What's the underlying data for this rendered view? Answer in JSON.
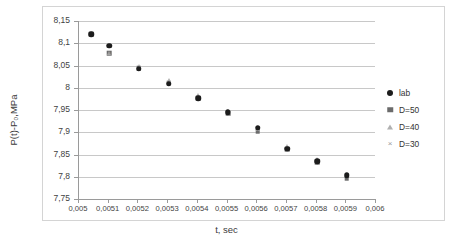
{
  "chart_data": {
    "type": "scatter",
    "title": "",
    "xlabel": "t, sec",
    "ylabel": "P(t)-P₀,MPa",
    "xlim": [
      0.005,
      0.006
    ],
    "ylim": [
      7.75,
      8.15
    ],
    "grid": true,
    "legend_position": "right",
    "x_ticks": [
      "0,005",
      "0,0051",
      "0,0052",
      "0,0053",
      "0,0054",
      "0,0055",
      "0,0056",
      "0,0057",
      "0,0058",
      "0,0059",
      "0,006"
    ],
    "x_tick_values": [
      0.005,
      0.0051,
      0.0052,
      0.0053,
      0.0054,
      0.0055,
      0.0056,
      0.0057,
      0.0058,
      0.0059,
      0.006
    ],
    "y_ticks": [
      "7,75",
      "7,8",
      "7,85",
      "7,9",
      "7,95",
      "8",
      "8,05",
      "8,1",
      "8,15"
    ],
    "y_tick_values": [
      7.75,
      7.8,
      7.85,
      7.9,
      7.95,
      8.0,
      8.05,
      8.1,
      8.15
    ],
    "x": [
      0.005045,
      0.005105,
      0.005205,
      0.005305,
      0.005405,
      0.005505,
      0.005605,
      0.005705,
      0.005805,
      0.005905
    ],
    "series": [
      {
        "name": "lab",
        "marker": "filled-circle",
        "color": "#1c1c1c",
        "values": [
          8.12,
          8.094,
          8.043,
          8.009,
          7.976,
          7.945,
          7.91,
          7.863,
          7.835,
          7.803
        ]
      },
      {
        "name": "D=50",
        "marker": "filled-square",
        "color": "#6b6b6b",
        "values": [
          8.12,
          8.077,
          8.044,
          8.011,
          7.977,
          7.943,
          7.902,
          7.862,
          7.833,
          7.797
        ]
      },
      {
        "name": "D=40",
        "marker": "triangle",
        "color": "#a8a8a8",
        "values": [
          8.12,
          8.078,
          8.05,
          8.018,
          7.983,
          7.948,
          7.908,
          7.868,
          7.839,
          7.804
        ]
      },
      {
        "name": "D=30",
        "marker": "cross",
        "color": "#8f8f8f",
        "values": [
          8.12,
          8.079,
          8.047,
          8.014,
          7.98,
          7.946,
          7.905,
          7.865,
          7.836,
          7.8
        ]
      }
    ]
  },
  "legend": {
    "items": [
      {
        "label": "lab",
        "marker": "filled-circle"
      },
      {
        "label": "D=50",
        "marker": "filled-square"
      },
      {
        "label": "D=40",
        "marker": "triangle"
      },
      {
        "label": "D=30",
        "marker": "cross"
      }
    ]
  }
}
